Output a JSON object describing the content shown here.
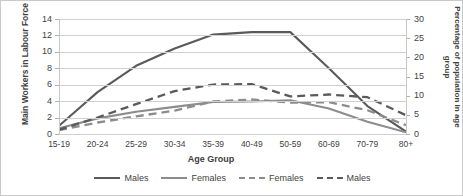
{
  "chart_data": {
    "type": "line",
    "title": "",
    "categories": [
      "15-19",
      "20-24",
      "25-29",
      "30-34",
      "35-39",
      "40-49",
      "50-59",
      "60-69",
      "70-79",
      "80+"
    ],
    "xlabel": "Age Group",
    "ylabel_left": "Main Workers in Labour Force",
    "ylabel_right": "Percentage of population in age group",
    "ylim_left": [
      0,
      14
    ],
    "ylim_right": [
      0,
      30
    ],
    "ytick_left": [
      "0",
      "2",
      "4",
      "6",
      "8",
      "10",
      "12",
      "14"
    ],
    "ytick_right": [
      "0",
      "5",
      "10",
      "15",
      "20",
      "25",
      "30"
    ],
    "grid": true,
    "legend_position": "bottom",
    "series": [
      {
        "name": "Males",
        "axis": "left",
        "style": "solid",
        "color": "#5a5a5a",
        "values": [
          1.0,
          5.1,
          8.3,
          10.4,
          12.1,
          12.4,
          12.4,
          8.0,
          3.4,
          0.3
        ]
      },
      {
        "name": "Females",
        "axis": "left",
        "style": "solid",
        "color": "#8c8c8c",
        "values": [
          0.7,
          1.9,
          2.7,
          3.3,
          3.9,
          3.95,
          4.1,
          3.1,
          1.5,
          0.2
        ]
      },
      {
        "name": "Females",
        "axis": "right",
        "style": "dashed",
        "color": "#8c8c8c",
        "values": [
          1.0,
          3.0,
          4.6,
          6.1,
          8.5,
          9.0,
          8.2,
          8.3,
          6.2,
          2.3
        ]
      },
      {
        "name": "Males",
        "axis": "right",
        "style": "dashed",
        "color": "#5a5a5a",
        "values": [
          1.1,
          4.3,
          7.8,
          11.2,
          12.9,
          13.0,
          9.8,
          10.3,
          9.6,
          4.9
        ]
      }
    ],
    "legend": [
      {
        "label": "Males",
        "color": "#5a5a5a",
        "style": "solid"
      },
      {
        "label": "Females",
        "color": "#8c8c8c",
        "style": "solid"
      },
      {
        "label": "Females",
        "color": "#8c8c8c",
        "style": "dashed"
      },
      {
        "label": "Males",
        "color": "#5a5a5a",
        "style": "dashed"
      }
    ]
  }
}
